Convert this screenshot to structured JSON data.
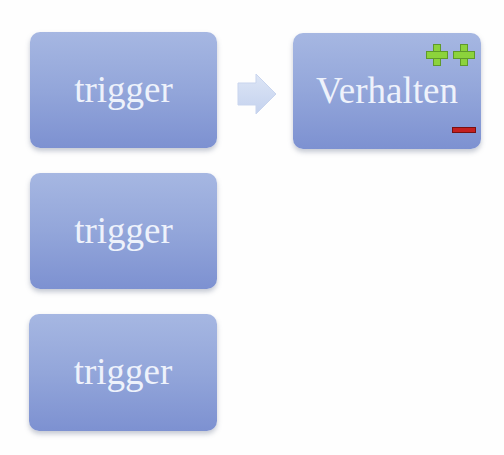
{
  "diagram": {
    "triggers": [
      {
        "label": "trigger"
      },
      {
        "label": "trigger"
      },
      {
        "label": "trigger"
      }
    ],
    "arrow": {
      "icon": "right-arrow-icon",
      "direction": "right"
    },
    "behavior": {
      "label": "Verhalten",
      "positive_marker": "++",
      "negative_marker": "−"
    }
  },
  "colors": {
    "box_top": "#a6b7e2",
    "box_bottom": "#7d91d1",
    "box_text": "#eef2fb",
    "arrow": "#d2ddf2",
    "plus": "#8cd33c",
    "minus": "#c41f1f",
    "background": "#fefefe"
  }
}
